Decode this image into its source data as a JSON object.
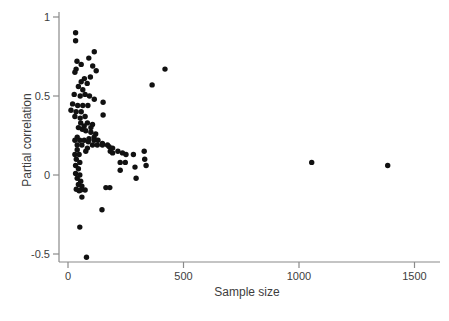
{
  "figure": {
    "background": "#ffffff"
  },
  "chart_data": {
    "type": "scatter",
    "title": "",
    "xlabel": "Sample size",
    "ylabel": "Partial correlation",
    "x_ticks": [
      0,
      500,
      1000,
      1500
    ],
    "y_ticks": [
      1,
      0.5,
      0,
      -0.5
    ],
    "xlim": [
      -40,
      1650
    ],
    "ylim": [
      -0.58,
      1.03
    ],
    "grid": false,
    "legend": "none",
    "marker_color": "#111111",
    "axis_color": "#8a8a8a",
    "label_color": "#3d3d3d",
    "marker_radius_px": 2.7,
    "points": [
      [
        33,
        0.9
      ],
      [
        33,
        0.85
      ],
      [
        114,
        0.78
      ],
      [
        90,
        0.74
      ],
      [
        39,
        0.72
      ],
      [
        57,
        0.7
      ],
      [
        107,
        0.69
      ],
      [
        35,
        0.67
      ],
      [
        122,
        0.66
      ],
      [
        30,
        0.65
      ],
      [
        97,
        0.62
      ],
      [
        71,
        0.61
      ],
      [
        57,
        0.59
      ],
      [
        83,
        0.58
      ],
      [
        45,
        0.56
      ],
      [
        64,
        0.54
      ],
      [
        420,
        0.67
      ],
      [
        364,
        0.57
      ],
      [
        27,
        0.51
      ],
      [
        53,
        0.5
      ],
      [
        74,
        0.51
      ],
      [
        93,
        0.5
      ],
      [
        114,
        0.48
      ],
      [
        152,
        0.46
      ],
      [
        20,
        0.45
      ],
      [
        42,
        0.44
      ],
      [
        64,
        0.44
      ],
      [
        86,
        0.44
      ],
      [
        13,
        0.41
      ],
      [
        35,
        0.4
      ],
      [
        57,
        0.4
      ],
      [
        30,
        0.37
      ],
      [
        53,
        0.36
      ],
      [
        74,
        0.37
      ],
      [
        152,
        0.38
      ],
      [
        55,
        0.33
      ],
      [
        84,
        0.33
      ],
      [
        106,
        0.32
      ],
      [
        70,
        0.31
      ],
      [
        45,
        0.3
      ],
      [
        99,
        0.3
      ],
      [
        62,
        0.29
      ],
      [
        77,
        0.28
      ],
      [
        99,
        0.27
      ],
      [
        120,
        0.26
      ],
      [
        113,
        0.24
      ],
      [
        40,
        0.24
      ],
      [
        91,
        0.23
      ],
      [
        30,
        0.22
      ],
      [
        51,
        0.22
      ],
      [
        70,
        0.22
      ],
      [
        113,
        0.22
      ],
      [
        130,
        0.22
      ],
      [
        149,
        0.2
      ],
      [
        40,
        0.19
      ],
      [
        60,
        0.19
      ],
      [
        88,
        0.21
      ],
      [
        106,
        0.19
      ],
      [
        127,
        0.19
      ],
      [
        149,
        0.19
      ],
      [
        171,
        0.19
      ],
      [
        84,
        0.17
      ],
      [
        40,
        0.16
      ],
      [
        30,
        0.13
      ],
      [
        48,
        0.13
      ],
      [
        77,
        0.15
      ],
      [
        178,
        0.18
      ],
      [
        193,
        0.17
      ],
      [
        183,
        0.15
      ],
      [
        193,
        0.14
      ],
      [
        216,
        0.15
      ],
      [
        236,
        0.14
      ],
      [
        251,
        0.13
      ],
      [
        283,
        0.13
      ],
      [
        330,
        0.15
      ],
      [
        332,
        0.1
      ],
      [
        36,
        0.1
      ],
      [
        51,
        0.08
      ],
      [
        33,
        0.06
      ],
      [
        45,
        0.04
      ],
      [
        33,
        0.01
      ],
      [
        51,
        0.0
      ],
      [
        226,
        0.08
      ],
      [
        248,
        0.08
      ],
      [
        290,
        0.05
      ],
      [
        338,
        0.06
      ],
      [
        226,
        0.03
      ],
      [
        1055,
        0.08
      ],
      [
        1384,
        0.06
      ],
      [
        40,
        -0.02
      ],
      [
        55,
        -0.04
      ],
      [
        45,
        -0.06
      ],
      [
        60,
        -0.07
      ],
      [
        48,
        -0.1
      ],
      [
        36,
        -0.09
      ],
      [
        55,
        -0.095
      ],
      [
        74,
        -0.095
      ],
      [
        164,
        -0.08
      ],
      [
        181,
        -0.08
      ],
      [
        295,
        -0.02
      ],
      [
        60,
        -0.14
      ],
      [
        147,
        -0.22
      ],
      [
        51,
        -0.33
      ],
      [
        80,
        -0.52
      ]
    ]
  }
}
